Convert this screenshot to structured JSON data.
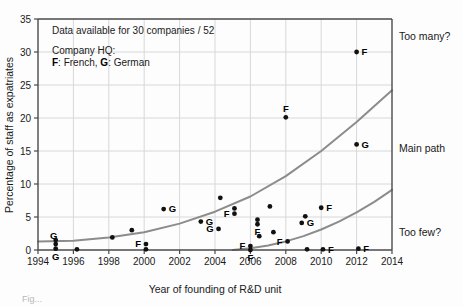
{
  "figure": {
    "caption_fragment": "Fig..."
  },
  "annotations": {
    "data_note": "Data available for 30 companies / 52",
    "legend_title": "Company HQ:",
    "legend_f_key": "F",
    "legend_f_text": ": French, ",
    "legend_g_key": "G",
    "legend_g_text": ": German"
  },
  "zones": {
    "too_many": "Too many?",
    "main_path": "Main path",
    "too_few": "Too few?"
  },
  "colors": {
    "curve": "#8c8c8c",
    "grid": "#d8d8d8",
    "axis": "#4a4a4a",
    "marker": "#111111"
  },
  "chart_data": {
    "type": "scatter",
    "title": "",
    "xlabel": "Year of founding of R&D unit",
    "ylabel": "Percentage of staff as expatriates",
    "xlim": [
      1994,
      2014
    ],
    "ylim": [
      0,
      35
    ],
    "xticks": [
      1994,
      1996,
      1998,
      2000,
      2002,
      2004,
      2006,
      2008,
      2010,
      2012,
      2014
    ],
    "yticks": [
      0,
      5,
      10,
      15,
      20,
      25,
      30,
      35
    ],
    "grid": true,
    "legend_position": "none",
    "points": [
      {
        "x": 1995.0,
        "y": 0.9,
        "label": "G",
        "label_pos": "above-left"
      },
      {
        "x": 1995.0,
        "y": 0.2,
        "label": "G",
        "label_pos": "below"
      },
      {
        "x": 1995.0,
        "y": 1.5,
        "label": "",
        "label_pos": ""
      },
      {
        "x": 1996.2,
        "y": 0.1,
        "label": "",
        "label_pos": ""
      },
      {
        "x": 1998.2,
        "y": 1.9,
        "label": "",
        "label_pos": ""
      },
      {
        "x": 1999.3,
        "y": 3.0,
        "label": "",
        "label_pos": ""
      },
      {
        "x": 2000.1,
        "y": 0.9,
        "label": "F",
        "label_pos": "left"
      },
      {
        "x": 2000.1,
        "y": 0.1,
        "label": "",
        "label_pos": ""
      },
      {
        "x": 2001.1,
        "y": 6.2,
        "label": "G",
        "label_pos": "right"
      },
      {
        "x": 2003.2,
        "y": 4.3,
        "label": "G",
        "label_pos": "right"
      },
      {
        "x": 2004.2,
        "y": 3.2,
        "label": "G",
        "label_pos": "left"
      },
      {
        "x": 2004.3,
        "y": 7.9,
        "label": "",
        "label_pos": ""
      },
      {
        "x": 2005.1,
        "y": 6.3,
        "label": "",
        "label_pos": ""
      },
      {
        "x": 2005.1,
        "y": 5.5,
        "label": "F",
        "label_pos": "left"
      },
      {
        "x": 2006.0,
        "y": 0.6,
        "label": "F",
        "label_pos": "left"
      },
      {
        "x": 2006.0,
        "y": 0.0,
        "label": "F",
        "label_pos": "below"
      },
      {
        "x": 2006.4,
        "y": 4.6,
        "label": "",
        "label_pos": ""
      },
      {
        "x": 2006.4,
        "y": 3.9,
        "label": "F",
        "label_pos": "below"
      },
      {
        "x": 2006.5,
        "y": 2.1,
        "label": "",
        "label_pos": ""
      },
      {
        "x": 2007.1,
        "y": 6.6,
        "label": "",
        "label_pos": ""
      },
      {
        "x": 2007.3,
        "y": 2.7,
        "label": "",
        "label_pos": ""
      },
      {
        "x": 2008.0,
        "y": 20.1,
        "label": "F",
        "label_pos": "above"
      },
      {
        "x": 2008.1,
        "y": 1.3,
        "label": "F",
        "label_pos": "left"
      },
      {
        "x": 2008.9,
        "y": 4.1,
        "label": "G",
        "label_pos": "right"
      },
      {
        "x": 2009.1,
        "y": 5.1,
        "label": "",
        "label_pos": ""
      },
      {
        "x": 2009.2,
        "y": 0.1,
        "label": "",
        "label_pos": ""
      },
      {
        "x": 2010.0,
        "y": 6.4,
        "label": "F",
        "label_pos": "right"
      },
      {
        "x": 2010.1,
        "y": 0.1,
        "label": "F",
        "label_pos": "right"
      },
      {
        "x": 2012.0,
        "y": 30.0,
        "label": "F",
        "label_pos": "right"
      },
      {
        "x": 2012.0,
        "y": 16.0,
        "label": "G",
        "label_pos": "right"
      },
      {
        "x": 2012.1,
        "y": 0.2,
        "label": "F",
        "label_pos": "right"
      }
    ],
    "curves": [
      {
        "name": "upper-bound",
        "points": [
          [
            1994,
            1.3
          ],
          [
            1996,
            1.4
          ],
          [
            1998,
            1.9
          ],
          [
            2000,
            2.7
          ],
          [
            2002,
            4.0
          ],
          [
            2004,
            5.8
          ],
          [
            2006,
            8.1
          ],
          [
            2008,
            11.2
          ],
          [
            2010,
            15.0
          ],
          [
            2012,
            19.4
          ],
          [
            2014,
            24.2
          ]
        ]
      },
      {
        "name": "lower-bound",
        "points": [
          [
            2005.0,
            0.0
          ],
          [
            2006,
            0.25
          ],
          [
            2007,
            0.7
          ],
          [
            2008,
            1.3
          ],
          [
            2009,
            2.1
          ],
          [
            2010,
            3.1
          ],
          [
            2011,
            4.3
          ],
          [
            2012,
            5.7
          ],
          [
            2013,
            7.3
          ],
          [
            2014,
            9.1
          ]
        ]
      }
    ]
  }
}
